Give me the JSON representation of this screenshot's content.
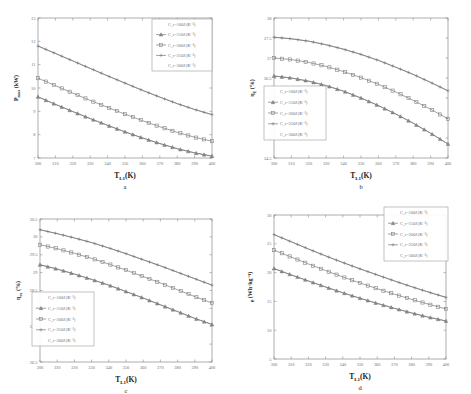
{
  "figure": {
    "background_color": "#ffffff",
    "line_color": "#7a7a7a",
    "axis_color": "#8a8a8a",
    "panels": [
      "a",
      "b",
      "c",
      "d"
    ]
  },
  "legend_series": [
    "C_r=100J/(K⁻¹)",
    "C_r=150J/(K⁻¹)",
    "C_r=200J/(K⁻¹)",
    "C_r=250J/(K⁻¹)",
    "C_r=300J/(K⁻¹)"
  ],
  "panel_labels": {
    "a": "a",
    "b": "b",
    "c": "c",
    "d": "d"
  },
  "xaxis": {
    "label_main": "T",
    "label_sub": "L1",
    "label_unit": "(K)",
    "ticks": [
      "300",
      "310",
      "320",
      "330",
      "340",
      "350",
      "360",
      "370",
      "380",
      "390",
      "400"
    ],
    "min": 300,
    "max": 400
  },
  "chart_data": [
    {
      "id": "a",
      "type": "line",
      "title": "",
      "panel_letter": "a",
      "xlabel": "T_L1(K)",
      "ylabel": "P_max (kW)",
      "ylabel_main": "P",
      "ylabel_sub": "max",
      "ylabel_unit": "(kW)",
      "xlim": [
        300,
        400
      ],
      "ylim": [
        7,
        13
      ],
      "xticks": [
        300,
        310,
        320,
        330,
        340,
        350,
        360,
        370,
        380,
        390,
        400
      ],
      "yticks": [
        7,
        8,
        9,
        10,
        11,
        12,
        13
      ],
      "ytick_labels": [
        "7",
        "8",
        "9",
        "10",
        "11",
        "12",
        "13"
      ],
      "grid": false,
      "legend_position": "top-right",
      "legend_entries": [
        "C_r=100J/(K⁻¹)",
        "C_r=150J/(K⁻¹)",
        "C_r=200J/(K⁻¹)",
        "C_r=250J/(K⁻¹)",
        "C_r=300J/(K⁻¹)"
      ],
      "x": [
        300,
        310,
        320,
        330,
        340,
        350,
        360,
        370,
        380,
        390,
        400
      ],
      "series": [
        {
          "name": "C_r=100J/(K⁻¹)",
          "marker": "none",
          "values": [
            9.62,
            9.3,
            8.99,
            8.69,
            8.4,
            8.12,
            7.86,
            7.62,
            7.4,
            7.22,
            7.08
          ]
        },
        {
          "name": "C_r=150J/(K⁻¹)",
          "marker": "triangle",
          "values": [
            9.62,
            9.3,
            8.99,
            8.69,
            8.4,
            8.12,
            7.86,
            7.62,
            7.4,
            7.22,
            7.08
          ]
        },
        {
          "name": "C_r=200J/(K⁻¹)",
          "marker": "square",
          "values": [
            10.42,
            10.1,
            9.78,
            9.47,
            9.17,
            8.88,
            8.6,
            8.34,
            8.1,
            7.89,
            7.72
          ]
        },
        {
          "name": "C_r=250J/(K⁻¹)",
          "marker": "plus",
          "values": [
            11.8,
            11.48,
            11.16,
            10.84,
            10.52,
            10.21,
            9.9,
            9.61,
            9.33,
            9.08,
            8.86
          ]
        },
        {
          "name": "C_r=300J/(K⁻¹)",
          "marker": "none",
          "values": [
            11.8,
            11.48,
            11.16,
            10.84,
            10.52,
            10.21,
            9.9,
            9.61,
            9.33,
            9.08,
            8.86
          ]
        }
      ]
    },
    {
      "id": "b",
      "type": "line",
      "title": "",
      "panel_letter": "b",
      "xlabel": "T_L1(K)",
      "ylabel": "η_E (%)",
      "ylabel_main": "η",
      "ylabel_sub": "E",
      "ylabel_unit": "(%)",
      "xlim": [
        300,
        400
      ],
      "ylim": [
        34.5,
        38
      ],
      "xticks": [
        300,
        310,
        320,
        330,
        340,
        350,
        360,
        370,
        380,
        390,
        400
      ],
      "yticks": [
        34.5,
        35,
        35.5,
        36,
        36.5,
        37,
        37.5,
        38
      ],
      "ytick_labels": [
        "34.5",
        "35",
        "35.5",
        "36",
        "36.5",
        "37",
        "37.5",
        "38"
      ],
      "grid": false,
      "legend_position": "lower-left",
      "legend_entries": [
        "C_r=100J/(K⁻¹)",
        "C_r=150J/(K⁻¹)",
        "C_r=200J/(K⁻¹)",
        "C_r=250J/(K⁻¹)",
        "C_r=300J/(K⁻¹)"
      ],
      "x": [
        300,
        310,
        320,
        330,
        340,
        350,
        360,
        370,
        380,
        390,
        400
      ],
      "series": [
        {
          "name": "C_r=100J/(K⁻¹)",
          "marker": "none",
          "values": [
            36.55,
            36.5,
            36.42,
            36.31,
            36.17,
            36.0,
            35.81,
            35.6,
            35.37,
            35.12,
            34.85
          ]
        },
        {
          "name": "C_r=150J/(K⁻¹)",
          "marker": "triangle",
          "values": [
            36.55,
            36.5,
            36.42,
            36.31,
            36.17,
            36.0,
            35.81,
            35.6,
            35.37,
            35.12,
            34.85
          ]
        },
        {
          "name": "C_r=200J/(K⁻¹)",
          "marker": "square",
          "values": [
            37.0,
            36.96,
            36.89,
            36.79,
            36.66,
            36.51,
            36.34,
            36.15,
            35.94,
            35.72,
            35.48
          ]
        },
        {
          "name": "C_r=250J/(K⁻¹)",
          "marker": "plus",
          "values": [
            37.52,
            37.48,
            37.42,
            37.33,
            37.22,
            37.09,
            36.94,
            36.77,
            36.59,
            36.39,
            36.18
          ]
        },
        {
          "name": "C_r=300J/(K⁻¹)",
          "marker": "none",
          "values": [
            37.52,
            37.48,
            37.42,
            37.33,
            37.22,
            37.09,
            36.94,
            36.77,
            36.59,
            36.39,
            36.18
          ]
        }
      ]
    },
    {
      "id": "c",
      "type": "line",
      "title": "",
      "panel_letter": "c",
      "xlabel": "T_L1(K)",
      "ylabel": "η_ex (%)",
      "ylabel_main": "η",
      "ylabel_sub": "ex",
      "ylabel_unit": "(%)",
      "xlim": [
        300,
        400
      ],
      "ylim": [
        26.5,
        30.5
      ],
      "xticks": [
        300,
        310,
        320,
        330,
        340,
        350,
        360,
        370,
        380,
        390,
        400
      ],
      "yticks": [
        26.5,
        27,
        27.5,
        28,
        28.5,
        29,
        29.5,
        30,
        30.5
      ],
      "ytick_labels": [
        "26.5",
        "27",
        "27.5",
        "28",
        "28.5",
        "29",
        "29.5",
        "30",
        "30.5"
      ],
      "grid": false,
      "legend_position": "lower-left",
      "legend_entries": [
        "C_r=100J/(K⁻¹)",
        "C_r=150J/(K⁻¹)",
        "C_r=200J/(K⁻¹)",
        "C_r=250J/(K⁻¹)",
        "C_r=300J/(K⁻¹)"
      ],
      "x": [
        300,
        310,
        320,
        330,
        340,
        350,
        360,
        370,
        380,
        390,
        400
      ],
      "series": [
        {
          "name": "C_r=100J/(K⁻¹)",
          "marker": "none",
          "values": [
            29.22,
            29.1,
            28.96,
            28.81,
            28.65,
            28.47,
            28.29,
            28.1,
            27.91,
            27.72,
            27.55
          ]
        },
        {
          "name": "C_r=150J/(K⁻¹)",
          "marker": "triangle",
          "values": [
            29.22,
            29.1,
            28.96,
            28.81,
            28.65,
            28.47,
            28.29,
            28.1,
            27.91,
            27.72,
            27.55
          ]
        },
        {
          "name": "C_r=200J/(K⁻¹)",
          "marker": "square",
          "values": [
            29.78,
            29.67,
            29.54,
            29.4,
            29.24,
            29.07,
            28.89,
            28.71,
            28.52,
            28.33,
            28.15
          ]
        },
        {
          "name": "C_r=250J/(K⁻¹)",
          "marker": "plus",
          "values": [
            30.2,
            30.09,
            29.97,
            29.84,
            29.69,
            29.53,
            29.36,
            29.19,
            29.01,
            28.83,
            28.65
          ]
        },
        {
          "name": "C_r=300J/(K⁻¹)",
          "marker": "none",
          "values": [
            30.2,
            30.09,
            29.97,
            29.84,
            29.69,
            29.53,
            29.36,
            29.19,
            29.01,
            28.83,
            28.65
          ]
        }
      ]
    },
    {
      "id": "d",
      "type": "line",
      "title": "",
      "panel_letter": "d",
      "xlabel": "T_L1(K)",
      "ylabel": "e (Wh·kg⁻¹)",
      "ylabel_main": "e",
      "ylabel_sub": "",
      "ylabel_unit": "(Wh·kg⁻¹)",
      "xlim": [
        300,
        400
      ],
      "ylim": [
        5,
        30
      ],
      "xticks": [
        300,
        310,
        320,
        330,
        340,
        350,
        360,
        370,
        380,
        390,
        400
      ],
      "yticks": [
        5,
        10,
        15,
        20,
        25,
        30
      ],
      "ytick_labels": [
        "5",
        "10",
        "15",
        "20",
        "25",
        "30"
      ],
      "grid": false,
      "legend_position": "top-right",
      "legend_entries": [
        "C_r=100J/(K⁻¹)",
        "C_r=150J/(K⁻¹)",
        "C_r=200J/(K⁻¹)",
        "C_r=250J/(K⁻¹)",
        "C_r=300J/(K⁻¹)"
      ],
      "x": [
        300,
        310,
        320,
        330,
        340,
        350,
        360,
        370,
        380,
        390,
        400
      ],
      "series": [
        {
          "name": "C_r=100J/(K⁻¹)",
          "marker": "none",
          "values": [
            20.7,
            19.6,
            18.55,
            17.5,
            16.5,
            15.55,
            14.65,
            13.8,
            13.0,
            12.25,
            11.6
          ]
        },
        {
          "name": "C_r=150J/(K⁻¹)",
          "marker": "triangle",
          "values": [
            20.7,
            19.6,
            18.55,
            17.5,
            16.5,
            15.55,
            14.65,
            13.8,
            13.0,
            12.25,
            11.6
          ]
        },
        {
          "name": "C_r=200J/(K⁻¹)",
          "marker": "square",
          "values": [
            23.9,
            22.7,
            21.5,
            20.35,
            19.25,
            18.2,
            17.2,
            16.25,
            15.35,
            14.5,
            13.7
          ]
        },
        {
          "name": "C_r=250J/(K⁻¹)",
          "marker": "plus",
          "values": [
            26.6,
            25.35,
            24.1,
            22.9,
            21.75,
            20.65,
            19.6,
            18.55,
            17.55,
            16.6,
            15.7
          ]
        },
        {
          "name": "C_r=300J/(K⁻¹)",
          "marker": "none",
          "values": [
            26.6,
            25.35,
            24.1,
            22.9,
            21.75,
            20.65,
            19.6,
            18.55,
            17.55,
            16.6,
            15.7
          ]
        }
      ]
    }
  ]
}
